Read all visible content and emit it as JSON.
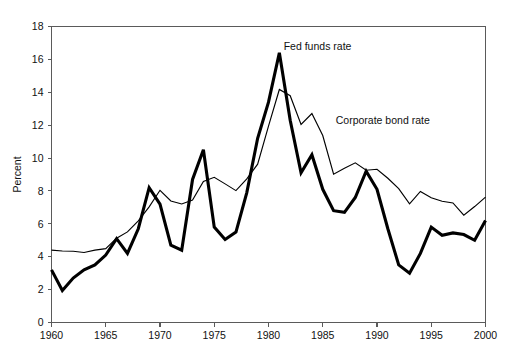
{
  "chart_data": {
    "type": "line",
    "title": "",
    "xlabel": "",
    "ylabel": "Percent",
    "xlim": [
      1960,
      2000
    ],
    "ylim": [
      0,
      18
    ],
    "ytick_step": 2,
    "xtick_step": 5,
    "grid": false,
    "legend_position": "inline-annotations",
    "x": [
      1960,
      1961,
      1962,
      1963,
      1964,
      1965,
      1966,
      1967,
      1968,
      1969,
      1970,
      1971,
      1972,
      1973,
      1974,
      1975,
      1976,
      1977,
      1978,
      1979,
      1980,
      1981,
      1982,
      1983,
      1984,
      1985,
      1986,
      1987,
      1988,
      1989,
      1990,
      1991,
      1992,
      1993,
      1994,
      1995,
      1996,
      1997,
      1998,
      1999,
      2000
    ],
    "yticks": [
      0,
      2,
      4,
      6,
      8,
      10,
      12,
      14,
      16,
      18
    ],
    "xticks": [
      1960,
      1965,
      1970,
      1975,
      1980,
      1985,
      1990,
      1995,
      2000
    ],
    "ytick_labels": [
      "0",
      "2",
      "4",
      "6",
      "8",
      "10",
      "12",
      "14",
      "16",
      "18"
    ],
    "xtick_labels": [
      "1960",
      "1965",
      "1970",
      "1975",
      "1980",
      "1985",
      "1990",
      "1995",
      "2000"
    ],
    "series": [
      {
        "name": "Fed funds rate",
        "style": "thick",
        "color": "#000000",
        "annotation_x": 1981.4,
        "annotation_y": 16.6,
        "values": [
          3.2,
          1.95,
          2.7,
          3.2,
          3.5,
          4.1,
          5.1,
          4.2,
          5.7,
          8.2,
          7.2,
          4.7,
          4.4,
          8.7,
          10.5,
          5.8,
          5.05,
          5.5,
          7.9,
          11.2,
          13.4,
          16.4,
          12.3,
          9.1,
          10.2,
          8.1,
          6.8,
          6.7,
          7.6,
          9.2,
          8.1,
          5.7,
          3.5,
          3.0,
          4.2,
          5.8,
          5.3,
          5.45,
          5.35,
          5.0,
          6.2
        ]
      },
      {
        "name": "Corporate bond rate",
        "style": "thin",
        "color": "#000000",
        "annotation_x": 1986.2,
        "annotation_y": 12.1,
        "values": [
          4.4,
          4.35,
          4.33,
          4.26,
          4.4,
          4.49,
          5.13,
          5.51,
          6.18,
          7.03,
          8.04,
          7.39,
          7.21,
          7.44,
          8.57,
          8.83,
          8.43,
          8.02,
          8.73,
          9.63,
          11.94,
          14.17,
          13.79,
          12.04,
          12.71,
          11.37,
          9.02,
          9.38,
          9.71,
          9.26,
          9.32,
          8.77,
          8.14,
          7.22,
          7.97,
          7.59,
          7.37,
          7.27,
          6.53,
          7.05,
          7.62
        ]
      }
    ]
  }
}
